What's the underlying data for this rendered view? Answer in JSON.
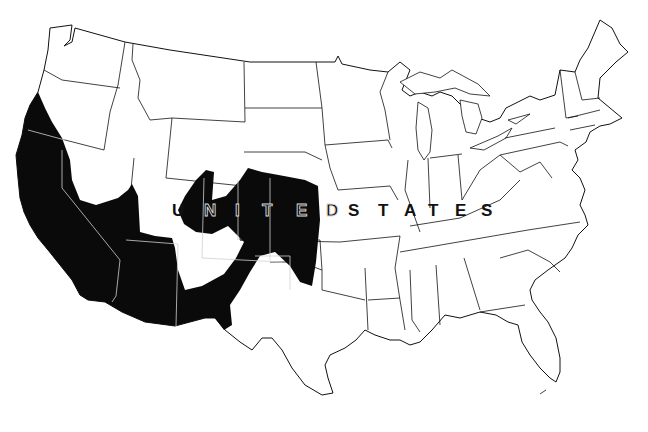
{
  "map": {
    "title": "",
    "country_label": "UNITED STATES",
    "label_letters": [
      {
        "char": "U",
        "x": 172,
        "style": "dark"
      },
      {
        "char": "N",
        "x": 204,
        "style": "outline"
      },
      {
        "char": "I",
        "x": 235,
        "style": "outline"
      },
      {
        "char": "T",
        "x": 262,
        "style": "outline"
      },
      {
        "char": "E",
        "x": 296,
        "style": "outline"
      },
      {
        "char": "D",
        "x": 326,
        "style": "outline"
      },
      {
        "char": "S",
        "x": 348,
        "style": "dark"
      },
      {
        "char": "T",
        "x": 378,
        "style": "dark"
      },
      {
        "char": "A",
        "x": 404,
        "style": "dark"
      },
      {
        "char": "T",
        "x": 428,
        "style": "dark"
      },
      {
        "char": "E",
        "x": 455,
        "style": "dark"
      },
      {
        "char": "S",
        "x": 481,
        "style": "dark"
      }
    ],
    "shaded_region_color": "#0a0a0a",
    "background_color": "#ffffff",
    "border_color": "#111111",
    "shaded_region_description": "Southwestern United States (California, southern Nevada, Arizona, southern Utah, Colorado, western Kansas, northern New Mexico, Oklahoma panhandle, west Texas)"
  }
}
